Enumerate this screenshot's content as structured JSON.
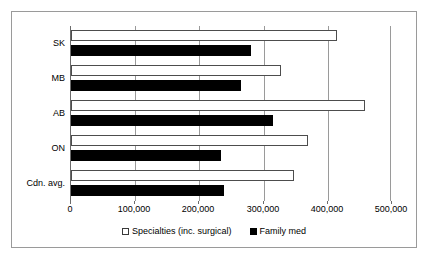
{
  "chart_data": {
    "type": "bar",
    "orientation": "horizontal",
    "title": "",
    "xlabel": "",
    "ylabel": "",
    "xlim": [
      0,
      500000
    ],
    "grid": true,
    "legend_position": "bottom",
    "categories": [
      "SK",
      "MB",
      "AB",
      "ON",
      "Cdn. avg."
    ],
    "xticks": [
      0,
      100000,
      200000,
      300000,
      400000,
      500000
    ],
    "xtick_labels": [
      "0",
      "100,000",
      "200,000",
      "300,000",
      "400,000",
      "500,000"
    ],
    "series": [
      {
        "name": "Specialties (inc. surgical)",
        "color": "#ffffff",
        "edge_color": "#4d4d4d",
        "values": [
          417000,
          329000,
          461000,
          372000,
          350000
        ]
      },
      {
        "name": "Family med",
        "color": "#000000",
        "edge_color": "#000000",
        "values": [
          282000,
          266000,
          316000,
          235000,
          240000
        ]
      }
    ]
  },
  "legend": {
    "entries": [
      {
        "label": "Specialties (inc. surgical)",
        "swatch": "open-square-icon"
      },
      {
        "label": "Family med",
        "swatch": "filled-square-icon"
      }
    ]
  },
  "colors": {
    "frame_border": "#9a9a9a",
    "gridline": "#9a9a9a",
    "axis_line": "#6b6b6b",
    "text": "#000000",
    "background": "#ffffff"
  }
}
